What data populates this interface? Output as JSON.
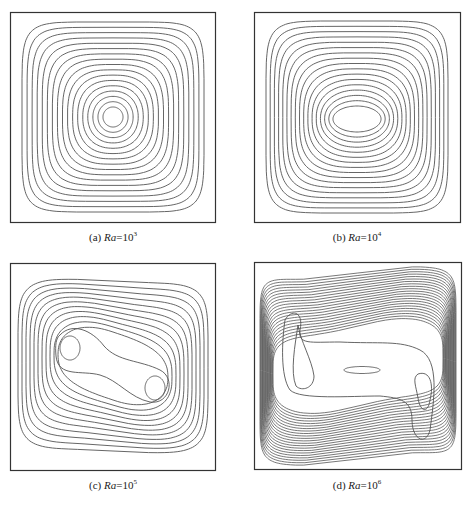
{
  "figure": {
    "panels": [
      {
        "id": "a",
        "label": "(a)",
        "var": "Ra",
        "eq": "=10",
        "exp": "3",
        "caption": "(a) Ra=10^3"
      },
      {
        "id": "b",
        "label": "(b)",
        "var": "Ra",
        "eq": "=10",
        "exp": "4",
        "caption": "(b) Ra=10^4"
      },
      {
        "id": "c",
        "label": "(c)",
        "var": "Ra",
        "eq": "=10",
        "exp": "5",
        "caption": "(c) Ra=10^5"
      },
      {
        "id": "d",
        "label": "(d)",
        "var": "Ra",
        "eq": "=10",
        "exp": "6",
        "caption": "(d) Ra=10^6"
      }
    ],
    "line_color": "#555555",
    "frame_color": "#333333"
  },
  "chart_data": [
    {
      "type": "contour",
      "title": "(a) Ra=10^3",
      "contour_levels": 17,
      "centers": 1,
      "shape": "single central circular vortex"
    },
    {
      "type": "contour",
      "title": "(b) Ra=10^4",
      "contour_levels": 17,
      "centers": 1,
      "shape": "single vortex, horizontally elongated ellipse at center"
    },
    {
      "type": "contour",
      "title": "(c) Ra=10^5",
      "contour_levels": 13,
      "centers": 2,
      "shape": "two secondary vortices (upper-left, lower-right) in peanut shaped core"
    },
    {
      "type": "contour",
      "title": "(d) Ra=10^6",
      "contour_levels": 22,
      "centers": 3,
      "shape": "thin boundary layers at vertical walls; elongated central eddy plus left and right secondary vortices"
    }
  ]
}
